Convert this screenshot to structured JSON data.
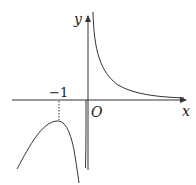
{
  "figure": {
    "type": "function-graph",
    "x_axis_label": "x",
    "y_axis_label": "y",
    "origin_label": "O",
    "x_tick_label": "−1",
    "x_tick_value": -1,
    "dashed_guide": "vertical dotted line from x = −1 tick down to the local maximum of the left branch",
    "curves": [
      {
        "name": "left-branch",
        "description": "curve for x < 0 below x-axis with a local maximum at x = −1, descending toward −∞ as x → 0⁻ and as x → −∞"
      },
      {
        "name": "right-branch",
        "description": "curve for x > 0 above x-axis, decreasing from +∞ near x → 0⁺ and approaching the x-axis as x → +∞"
      }
    ],
    "colors": {
      "stroke": "#333333",
      "background": "#ffffff"
    }
  }
}
